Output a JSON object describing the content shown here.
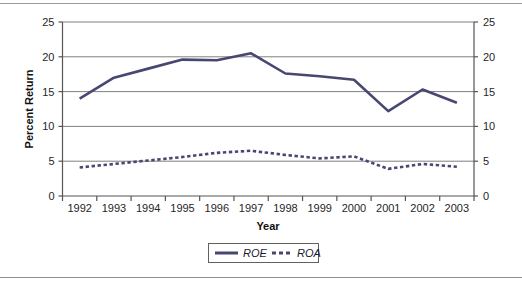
{
  "figure": {
    "background": "#ffffff",
    "series_color": "#474771",
    "axis_color": "#555555",
    "grid_color": "#7f7f7f"
  },
  "chart_data": {
    "type": "line",
    "title": "",
    "xlabel": "Year",
    "ylabel": "Percent Return",
    "categories": [
      "1992",
      "1993",
      "1994",
      "1995",
      "1996",
      "1997",
      "1998",
      "1999",
      "2000",
      "2001",
      "2002",
      "2003"
    ],
    "ylim": [
      0,
      25
    ],
    "yticks": [
      0,
      5,
      10,
      15,
      20,
      25
    ],
    "ytick_labels_left": [
      "0",
      "5",
      "10",
      "15",
      "20",
      "25"
    ],
    "ytick_labels_right": [
      "0",
      "5",
      "10",
      "15",
      "20",
      "25"
    ],
    "grid": "horizontal",
    "right_axis": true,
    "legend_position": "bottom-center",
    "series": [
      {
        "name": "ROE",
        "style": "solid",
        "color": "#474771",
        "values": [
          14.0,
          17.0,
          18.3,
          19.6,
          19.5,
          20.5,
          17.6,
          17.2,
          16.7,
          12.2,
          15.3,
          13.4
        ]
      },
      {
        "name": "ROA",
        "style": "dotted",
        "color": "#474771",
        "values": [
          4.1,
          4.6,
          5.1,
          5.6,
          6.2,
          6.5,
          5.9,
          5.4,
          5.7,
          3.9,
          4.6,
          4.2
        ]
      }
    ]
  },
  "legend": {
    "entries": [
      {
        "label": "ROE",
        "marker": "solid-line"
      },
      {
        "label": "ROA",
        "marker": "dotted-line"
      }
    ]
  }
}
